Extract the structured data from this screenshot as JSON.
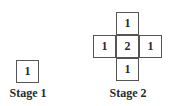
{
  "stages": [
    {
      "label": "Stage 1",
      "cells": [
        {
          "value": "1"
        }
      ]
    },
    {
      "label": "Stage 2",
      "cells": [
        {
          "position": "top",
          "value": "1"
        },
        {
          "position": "left",
          "value": "1"
        },
        {
          "position": "center",
          "value": "2"
        },
        {
          "position": "right",
          "value": "1"
        },
        {
          "position": "bottom",
          "value": "1"
        }
      ]
    }
  ]
}
